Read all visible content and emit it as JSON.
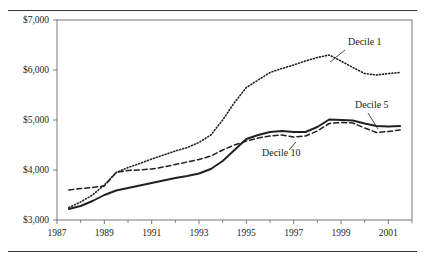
{
  "chart_data": {
    "type": "line",
    "title": "",
    "subtitle": "",
    "xlabel": "",
    "ylabel": "",
    "xlim": [
      1987,
      2002
    ],
    "ylim": [
      3000,
      7000
    ],
    "grid": false,
    "legend_position": "inline-annotations",
    "y_tick_labels": [
      "$7,000",
      "$6,000",
      "$5,000",
      "$4,000",
      "$3,000"
    ],
    "y_tick_values": [
      7000,
      6000,
      5000,
      4000,
      3000
    ],
    "x_tick_labels": [
      "1987",
      "1989",
      "1991",
      "1993",
      "1995",
      "1997",
      "1999",
      "2001"
    ],
    "x_tick_values": [
      1987,
      1989,
      1991,
      1993,
      1995,
      1997,
      1999,
      2001
    ],
    "x_minor_tick_values": [
      1988,
      1990,
      1992,
      1994,
      1996,
      1998,
      2000,
      2002
    ],
    "x": [
      1987.5,
      1988,
      1988.5,
      1989,
      1989.5,
      1990,
      1990.5,
      1991,
      1991.5,
      1992,
      1992.5,
      1993,
      1993.5,
      1994,
      1994.5,
      1995,
      1995.5,
      1996,
      1996.5,
      1997,
      1997.5,
      1998,
      1998.5,
      1999,
      1999.5,
      2000,
      2000.5,
      2001,
      2001.5
    ],
    "series": [
      {
        "name": "Decile 1",
        "style": "dotted",
        "color": "#231f20",
        "values": [
          3250,
          3360,
          3500,
          3700,
          3950,
          4050,
          4130,
          4220,
          4300,
          4380,
          4450,
          4550,
          4700,
          5000,
          5350,
          5650,
          5800,
          5950,
          6030,
          6100,
          6180,
          6250,
          6300,
          6180,
          6050,
          5930,
          5900,
          5930,
          5950
        ]
      },
      {
        "name": "Decile 5",
        "style": "solid",
        "color": "#231f20",
        "values": [
          3220,
          3280,
          3380,
          3500,
          3590,
          3640,
          3690,
          3740,
          3790,
          3840,
          3880,
          3930,
          4020,
          4180,
          4400,
          4620,
          4700,
          4760,
          4780,
          4760,
          4760,
          4860,
          5010,
          5000,
          4990,
          4930,
          4880,
          4870,
          4880
        ]
      },
      {
        "name": "Decile 10",
        "style": "dashed",
        "color": "#231f20",
        "values": [
          3600,
          3630,
          3650,
          3680,
          3950,
          3990,
          4000,
          4020,
          4060,
          4110,
          4160,
          4210,
          4280,
          4400,
          4500,
          4580,
          4640,
          4680,
          4700,
          4660,
          4680,
          4780,
          4930,
          4950,
          4940,
          4840,
          4750,
          4770,
          4800
        ]
      }
    ],
    "annotations": [
      {
        "label": "Decile 1",
        "series": "Decile 1",
        "label_x": 348,
        "label_y": 45,
        "leader_from": [
          345,
          50
        ],
        "leader_to": [
          330,
          62
        ]
      },
      {
        "label": "Decile 5",
        "series": "Decile 5",
        "label_x": 355,
        "label_y": 108,
        "leader_from": [
          368,
          113
        ],
        "leader_to": [
          378,
          129
        ]
      },
      {
        "label": "Decile 10",
        "series": "Decile 10",
        "label_x": 262,
        "label_y": 156,
        "leader_from": [
          289,
          150
        ],
        "leader_to": [
          296,
          142
        ]
      }
    ]
  },
  "figure": {
    "top_rule_name": "top-rule",
    "bottom_rule_name": "bottom-rule"
  }
}
